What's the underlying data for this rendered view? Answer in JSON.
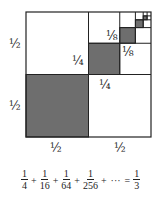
{
  "diagram": {
    "colors": {
      "shaded": "#6e6e6e",
      "stroke": "#222222",
      "background": "#ffffff"
    },
    "labels": {
      "left_top": "½",
      "left_bottom": "½",
      "bottom_left": "½",
      "bottom_right": "½",
      "quarter_vertical": "¼",
      "quarter_horizontal": "¼",
      "eighth_vertical": "⅛",
      "eighth_horizontal": "⅛"
    }
  },
  "equation": {
    "terms": [
      {
        "num": "1",
        "den": "4"
      },
      {
        "num": "1",
        "den": "16"
      },
      {
        "num": "1",
        "den": "64"
      },
      {
        "num": "1",
        "den": "256"
      }
    ],
    "plus": "+",
    "ellipsis": "···",
    "equals": "=",
    "result": {
      "num": "1",
      "den": "3"
    }
  }
}
